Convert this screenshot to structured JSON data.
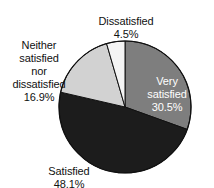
{
  "chart_data": {
    "type": "pie",
    "title": "",
    "subtitle": "",
    "xlabel": "",
    "ylabel": "",
    "legend_position": "none",
    "grid": false,
    "start_angle_deg": 0,
    "direction": "clockwise",
    "categories": [
      "Very satisfied",
      "Satisfied",
      "Neither satisfied nor dissatisfied",
      "Dissatisfied"
    ],
    "values": [
      30.5,
      48.1,
      16.9,
      4.5
    ],
    "value_unit": "%",
    "slices": [
      {
        "name": "very-satisfied",
        "label": "Very\nsatisfied",
        "label_line1": "Very",
        "label_line2": "satisfied",
        "percent_text": "30.5%",
        "value": 30.5,
        "color": "#7e7e7e",
        "text_color": "#ffffff",
        "label_placement": "inside"
      },
      {
        "name": "satisfied",
        "label": "Satisfied",
        "percent_text": "48.1%",
        "value": 48.1,
        "color": "#1c1c1c",
        "text_color": "#111111",
        "label_placement": "outside-bottom-left"
      },
      {
        "name": "neither-satisfied-nor-dissatisfied",
        "label": "Neither\nsatisfied\nnor\ndissatisfied",
        "percent_text": "16.9%",
        "value": 16.9,
        "color": "#d2d2d2",
        "text_color": "#111111",
        "label_placement": "outside-left"
      },
      {
        "name": "dissatisfied",
        "label": "Dissatisfied",
        "percent_text": "4.5%",
        "value": 4.5,
        "color": "#f4f4f4",
        "text_color": "#111111",
        "label_placement": "outside-top"
      }
    ],
    "outline_color": "#111111",
    "background_color": "#ffffff",
    "geometry": {
      "center_x": 125,
      "center_y": 107,
      "radius": 66
    }
  }
}
